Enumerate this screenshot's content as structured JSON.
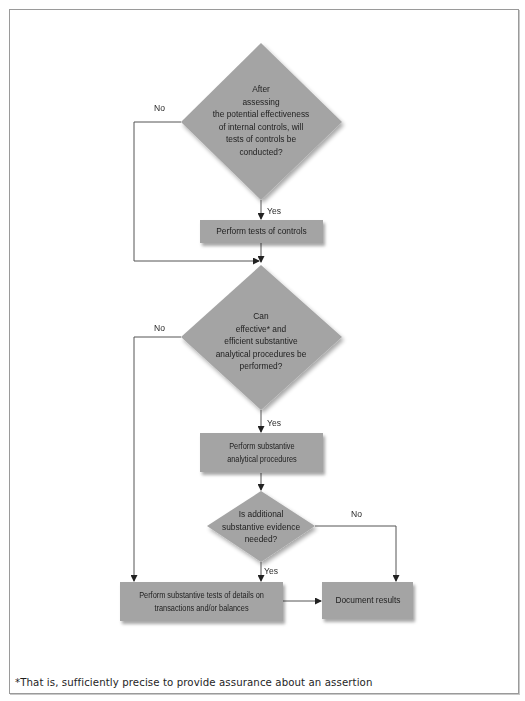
{
  "diagram": {
    "type": "flowchart",
    "colors": {
      "shape_fill": "#a4a4a4",
      "line": "#555555",
      "frame_border": "#9a9a9a",
      "text": "#1e1e1e"
    },
    "decisions": [
      {
        "id": "d1",
        "lines": [
          "After",
          "assessing",
          "the potential effectiveness",
          "of internal controls, will",
          "tests of controls be",
          "conducted?"
        ]
      },
      {
        "id": "d2",
        "lines": [
          "Can",
          "effective* and",
          "efficient substantive",
          "analytical procedures be",
          "performed?"
        ]
      },
      {
        "id": "d3",
        "lines": [
          "Is additional",
          "substantive evidence",
          "needed?"
        ]
      }
    ],
    "processes": [
      {
        "id": "p1",
        "lines": [
          "Perform tests of controls"
        ]
      },
      {
        "id": "p2",
        "lines": [
          "Perform substantive",
          "analytical procedures"
        ]
      },
      {
        "id": "p3",
        "lines": [
          "Perform substantive tests of details on",
          "transactions and/or balances"
        ]
      },
      {
        "id": "p4",
        "lines": [
          "Document results"
        ]
      }
    ],
    "edge_labels": {
      "d1_yes": "Yes",
      "d1_no": "No",
      "d2_yes": "Yes",
      "d2_no": "No",
      "d3_yes": "Yes",
      "d3_no": "No"
    },
    "edges": [
      {
        "from": "d1",
        "to": "p1",
        "label": "Yes"
      },
      {
        "from": "d1",
        "to": "d2",
        "label": "No"
      },
      {
        "from": "p1",
        "to": "d2",
        "label": ""
      },
      {
        "from": "d2",
        "to": "p2",
        "label": "Yes"
      },
      {
        "from": "d2",
        "to": "p3",
        "label": "No"
      },
      {
        "from": "p2",
        "to": "d3",
        "label": ""
      },
      {
        "from": "d3",
        "to": "p3",
        "label": "Yes"
      },
      {
        "from": "d3",
        "to": "p4",
        "label": "No"
      },
      {
        "from": "p3",
        "to": "p4",
        "label": ""
      }
    ],
    "footnote": "*That is, sufficiently precise to provide assurance about an assertion"
  }
}
